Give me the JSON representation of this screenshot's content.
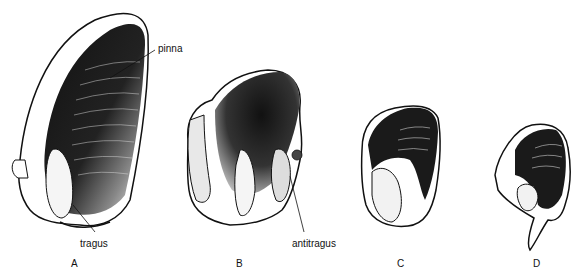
{
  "figure": {
    "panels": [
      {
        "id": "A",
        "label": "A"
      },
      {
        "id": "B",
        "label": "B"
      },
      {
        "id": "C",
        "label": "C"
      },
      {
        "id": "D",
        "label": "D"
      }
    ],
    "annotations": {
      "pinna": "pinna",
      "tragus": "tragus",
      "antitragus": "antitragus"
    },
    "colors": {
      "ink": "#111111",
      "background": "#ffffff"
    }
  }
}
